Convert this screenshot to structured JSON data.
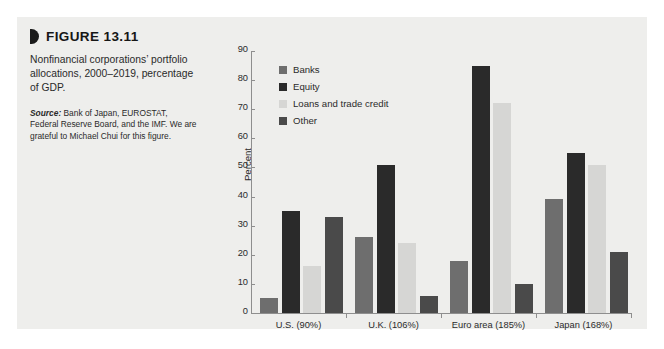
{
  "figure": {
    "label": "FIGURE 13.11",
    "caption": "Nonfinancial corporations’ portfolio allocations, 2000–2019, percentage of GDP.",
    "source_word": "Source:",
    "source_text": " Bank of Japan, EUROSTAT, Federal Reserve Board, and the IMF. We are grateful to Michael Chui for this figure."
  },
  "colors": {
    "panel_bg": "#eeeeec",
    "page_bg": "#ffffff",
    "axis": "#8e8e8e",
    "text": "#2b2b2b",
    "banks": "#6e6e6e",
    "equity": "#2a2a2a",
    "loans": "#d6d6d4",
    "other": "#4a4a4a"
  },
  "chart_data": {
    "type": "bar",
    "title": "",
    "xlabel": "",
    "ylabel": "Percent",
    "ylim": [
      0,
      90
    ],
    "yticks": [
      0,
      10,
      20,
      30,
      40,
      50,
      60,
      70,
      80,
      90
    ],
    "grid": false,
    "legend_position": "top-left inside",
    "categories": [
      "U.S. (90%)",
      "U.K. (106%)",
      "Euro area (185%)",
      "Japan (168%)"
    ],
    "series": [
      {
        "name": "Banks",
        "color": "#6e6e6e",
        "values": [
          5,
          26,
          18,
          39
        ]
      },
      {
        "name": "Equity",
        "color": "#2a2a2a",
        "values": [
          35,
          51,
          85,
          55
        ]
      },
      {
        "name": "Loans and trade credit",
        "color": "#d6d6d4",
        "values": [
          16,
          24,
          72,
          51
        ]
      },
      {
        "name": "Other",
        "color": "#4a4a4a",
        "values": [
          33,
          6,
          10,
          21
        ]
      }
    ]
  }
}
